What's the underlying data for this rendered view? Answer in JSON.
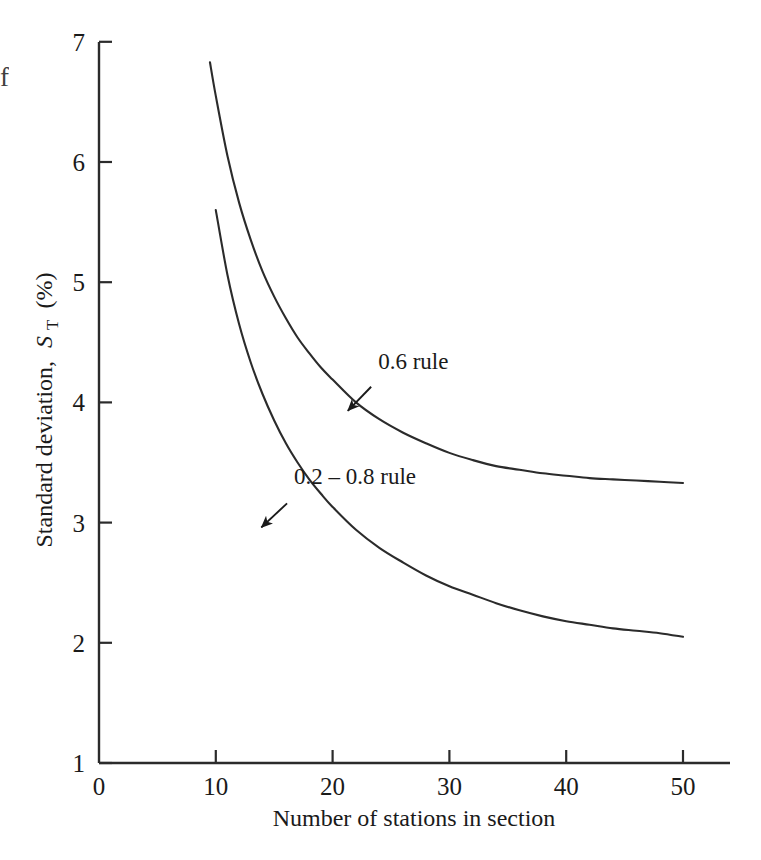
{
  "figure": {
    "background_color": "#ffffff",
    "line_color": "#2b2b2b",
    "text_color": "#1a1a1a",
    "edge_fragment": "f"
  },
  "chart_data": {
    "type": "line",
    "title": "",
    "xlabel": "Number of stations in section",
    "ylabel_main": "Standard deviation,",
    "ylabel_symbol": "S",
    "ylabel_subscript": "T",
    "ylabel_units": "(%)",
    "xlim": [
      0,
      54
    ],
    "ylim": [
      1,
      7
    ],
    "xticks": [
      0,
      10,
      20,
      30,
      40,
      50
    ],
    "xticklabels": [
      "0",
      "10",
      "20",
      "30",
      "40",
      "50"
    ],
    "yticks": [
      1,
      2,
      3,
      4,
      5,
      6,
      7
    ],
    "yticklabels": [
      "1",
      "2",
      "3",
      "4",
      "5",
      "6",
      "7"
    ],
    "grid": false,
    "legend_position": "inline-annotations",
    "series": [
      {
        "name": "0.6 rule",
        "label": "0.6 rule",
        "x": [
          9.5,
          10,
          11,
          12,
          13,
          14,
          15,
          16,
          17,
          18,
          19,
          20,
          22,
          24,
          26,
          28,
          30,
          32,
          34,
          36,
          38,
          40,
          42,
          44,
          46,
          48,
          50
        ],
        "y": [
          6.83,
          6.55,
          6.05,
          5.66,
          5.35,
          5.09,
          4.88,
          4.7,
          4.54,
          4.41,
          4.29,
          4.19,
          4.0,
          3.86,
          3.75,
          3.66,
          3.58,
          3.52,
          3.47,
          3.44,
          3.41,
          3.39,
          3.37,
          3.36,
          3.35,
          3.34,
          3.33
        ]
      },
      {
        "name": "0.2 - 0.8 rule",
        "label": "0.2 – 0.8 rule",
        "x": [
          10,
          11,
          12,
          13,
          14,
          15,
          16,
          17,
          18,
          19,
          20,
          22,
          24,
          26,
          28,
          30,
          32,
          34,
          36,
          38,
          40,
          42,
          44,
          46,
          48,
          50
        ],
        "y": [
          5.6,
          5.06,
          4.65,
          4.33,
          4.07,
          3.85,
          3.66,
          3.5,
          3.36,
          3.24,
          3.13,
          2.94,
          2.79,
          2.67,
          2.56,
          2.47,
          2.4,
          2.33,
          2.27,
          2.22,
          2.18,
          2.15,
          2.12,
          2.1,
          2.08,
          2.05
        ]
      }
    ],
    "annotations": [
      {
        "name": "0.6 rule",
        "text": "0.6 rule",
        "label_x": 23.9,
        "label_y": 4.28,
        "arrow_from_x": 23.3,
        "arrow_from_y": 4.13,
        "arrow_to_x": 21.3,
        "arrow_to_y": 3.93
      },
      {
        "name": "0.2 - 0.8 rule",
        "text": "0.2 – 0.8 rule",
        "label_x": 16.7,
        "label_y": 3.32,
        "arrow_from_x": 16.1,
        "arrow_from_y": 3.16,
        "arrow_to_x": 13.9,
        "arrow_to_y": 2.96
      }
    ]
  }
}
